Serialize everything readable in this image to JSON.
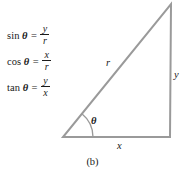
{
  "figure": {
    "caption": "(b)",
    "theta_symbol": "θ",
    "equals": "=",
    "formulas": [
      {
        "name": "sine-formula",
        "function": "sin",
        "angle": "θ",
        "numerator": "y",
        "denominator": "r"
      },
      {
        "name": "cosine-formula",
        "function": "cos",
        "angle": "θ",
        "numerator": "x",
        "denominator": "r"
      },
      {
        "name": "tangent-formula",
        "function": "tan",
        "angle": "θ",
        "numerator": "y",
        "denominator": "x"
      }
    ],
    "triangle": {
      "hypotenuse_label": "r",
      "vertical_leg_label": "y",
      "horizontal_leg_label": "x",
      "angle_label": "θ",
      "stroke_color": "#9a9a9a",
      "stroke_width": 2,
      "vertices": {
        "bottom_left": [
          63,
          137
        ],
        "bottom_right": [
          170,
          137
        ],
        "top_right": [
          171,
          4
        ]
      },
      "angle_arc": {
        "center": [
          63,
          137
        ],
        "radius": 30,
        "start_deg": 0,
        "end_deg": 51
      }
    }
  }
}
